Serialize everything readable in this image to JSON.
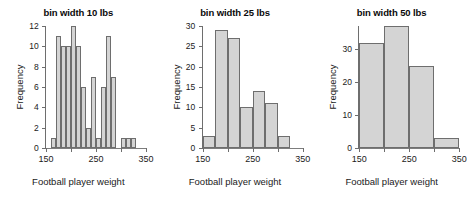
{
  "figure": {
    "shared_xlabel": "Football player weight",
    "shared_ylabel": "Frequency",
    "bar_fill": "#d4d4d4",
    "bar_border": "#6e6e6e"
  },
  "chart_data": [
    {
      "type": "bar",
      "title": "bin width 10 lbs",
      "xlabel": "Football player weight",
      "ylabel": "Frequency",
      "bin_width": 10,
      "xlim": [
        150,
        350
      ],
      "ylim": [
        0,
        12
      ],
      "grid": false,
      "legend": "none",
      "xticks": [
        150,
        200,
        250,
        300,
        350
      ],
      "xtick_labels": [
        "150",
        "",
        "250",
        "",
        "350"
      ],
      "yticks": [
        0,
        2,
        4,
        6,
        8,
        10,
        12
      ],
      "ytick_labels": [
        "0",
        "2",
        "4",
        "6",
        "8",
        "10",
        "12"
      ],
      "bin_starts": [
        160,
        170,
        180,
        190,
        200,
        210,
        220,
        230,
        240,
        250,
        260,
        270,
        280,
        290,
        300,
        310,
        320
      ],
      "categories": [
        "160-170",
        "170-180",
        "180-190",
        "190-200",
        "200-210",
        "210-220",
        "220-230",
        "230-240",
        "240-250",
        "250-260",
        "260-270",
        "270-280",
        "280-290",
        "290-300",
        "300-310",
        "310-320",
        "320-330"
      ],
      "values": [
        1,
        11,
        10,
        10,
        12,
        10,
        6,
        2,
        7,
        1,
        6,
        11,
        7,
        0,
        1,
        1,
        1
      ]
    },
    {
      "type": "bar",
      "title": "bin width 25 lbs",
      "xlabel": "Football player weight",
      "ylabel": "Frequency",
      "bin_width": 25,
      "xlim": [
        150,
        350
      ],
      "ylim": [
        0,
        30
      ],
      "grid": false,
      "legend": "none",
      "xticks": [
        150,
        200,
        250,
        300,
        350
      ],
      "xtick_labels": [
        "150",
        "",
        "250",
        "",
        "350"
      ],
      "yticks": [
        0,
        5,
        10,
        15,
        20,
        25,
        30
      ],
      "ytick_labels": [
        "0",
        "5",
        "10",
        "15",
        "20",
        "25",
        "30"
      ],
      "bin_starts": [
        150,
        175,
        200,
        225,
        250,
        275,
        300
      ],
      "categories": [
        "150-175",
        "175-200",
        "200-225",
        "225-250",
        "250-275",
        "275-300",
        "300-325"
      ],
      "values": [
        3,
        29,
        27,
        10,
        14,
        11,
        3
      ]
    },
    {
      "type": "bar",
      "title": "bin width 50 lbs",
      "xlabel": "Football player weight",
      "ylabel": "Frequency",
      "bin_width": 50,
      "xlim": [
        150,
        350
      ],
      "ylim": [
        0,
        37
      ],
      "grid": false,
      "legend": "none",
      "xticks": [
        150,
        200,
        250,
        300,
        350
      ],
      "xtick_labels": [
        "150",
        "",
        "250",
        "",
        "350"
      ],
      "yticks": [
        0,
        10,
        20,
        30
      ],
      "ytick_labels": [
        "0",
        "10",
        "20",
        "30"
      ],
      "bin_starts": [
        150,
        200,
        250,
        300
      ],
      "categories": [
        "150-200",
        "200-250",
        "250-300",
        "300-350"
      ],
      "values": [
        32,
        37,
        25,
        3
      ]
    }
  ]
}
